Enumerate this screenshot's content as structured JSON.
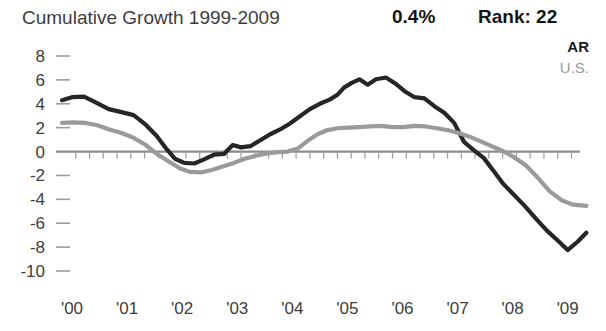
{
  "header": {
    "title": "Cumulative Growth 1999-2009",
    "growth_value": "0.4%",
    "rank_value": "Rank: 22"
  },
  "legend": {
    "entries": [
      {
        "label": "AR",
        "color": "#262626"
      },
      {
        "label": "U.S.",
        "color": "#9a9a9a"
      }
    ]
  },
  "chart_data": {
    "type": "line",
    "title": "Cumulative Growth 1999-2009",
    "xlabel": "",
    "ylabel": "",
    "ylim": [
      -10,
      8
    ],
    "xlim": [
      0,
      9.55
    ],
    "grid": false,
    "legend_position": "top-right",
    "y_ticks": [
      8,
      6,
      4,
      2,
      0,
      -2,
      -4,
      -6,
      -8,
      -10
    ],
    "y_tick_labels": [
      "8",
      "6",
      "4",
      "2",
      "0",
      "-2",
      "-4",
      "-6",
      "-8",
      "-10"
    ],
    "x_ticks": [
      0,
      1,
      2,
      3,
      4,
      5,
      6,
      7,
      8,
      9
    ],
    "x_tick_labels": [
      "'00",
      "'01",
      "'02",
      "'03",
      "'04",
      "'05",
      "'06",
      "'07",
      "'08",
      "'09"
    ],
    "annotations": [
      {
        "text": "0.4%",
        "role": "cumulative-growth"
      },
      {
        "text": "Rank: 22",
        "role": "rank"
      }
    ],
    "series": [
      {
        "name": "AR",
        "color": "#262626",
        "width": 4.2,
        "x": [
          0.0,
          0.18,
          0.4,
          0.62,
          0.85,
          1.08,
          1.3,
          1.52,
          1.72,
          1.9,
          2.05,
          2.22,
          2.4,
          2.58,
          2.76,
          2.94,
          3.1,
          3.25,
          3.42,
          3.6,
          3.78,
          3.96,
          4.14,
          4.32,
          4.5,
          4.68,
          4.86,
          5.0,
          5.12,
          5.26,
          5.4,
          5.55,
          5.7,
          5.88,
          6.05,
          6.22,
          6.4,
          6.58,
          6.76,
          6.94,
          7.12,
          7.3,
          7.48,
          7.66,
          7.84,
          8.02,
          8.2,
          8.4,
          8.6,
          8.8,
          9.0,
          9.18,
          9.36,
          9.52
        ],
        "y": [
          4.3,
          4.55,
          4.6,
          4.1,
          3.55,
          3.3,
          3.05,
          2.25,
          1.3,
          0.2,
          -0.6,
          -0.95,
          -1.0,
          -0.65,
          -0.25,
          -0.2,
          0.55,
          0.35,
          0.45,
          0.95,
          1.45,
          1.85,
          2.35,
          2.95,
          3.55,
          4.0,
          4.35,
          4.75,
          5.35,
          5.75,
          6.05,
          5.6,
          6.05,
          6.2,
          5.7,
          5.05,
          4.55,
          4.45,
          3.8,
          3.25,
          2.4,
          0.8,
          0.1,
          -0.55,
          -1.65,
          -2.75,
          -3.6,
          -4.55,
          -5.6,
          -6.6,
          -7.45,
          -8.25,
          -7.55,
          -6.8
        ],
        "end_value": -6.8
      },
      {
        "name": "U.S.",
        "color": "#9a9a9a",
        "width": 4.2,
        "x": [
          0.0,
          0.2,
          0.42,
          0.64,
          0.86,
          1.08,
          1.3,
          1.52,
          1.74,
          1.96,
          2.14,
          2.32,
          2.52,
          2.72,
          2.92,
          3.12,
          3.32,
          3.52,
          3.72,
          3.92,
          4.1,
          4.28,
          4.46,
          4.64,
          4.82,
          5.0,
          5.2,
          5.4,
          5.6,
          5.8,
          6.0,
          6.2,
          6.4,
          6.6,
          6.8,
          7.0,
          7.2,
          7.4,
          7.6,
          7.8,
          8.0,
          8.2,
          8.42,
          8.64,
          8.86,
          9.08,
          9.28,
          9.52
        ],
        "y": [
          2.4,
          2.45,
          2.4,
          2.2,
          1.85,
          1.55,
          1.15,
          0.55,
          -0.25,
          -0.9,
          -1.4,
          -1.7,
          -1.75,
          -1.55,
          -1.25,
          -0.95,
          -0.6,
          -0.35,
          -0.15,
          -0.05,
          0.0,
          0.25,
          0.9,
          1.45,
          1.8,
          1.95,
          2.0,
          2.05,
          2.1,
          2.15,
          2.05,
          2.05,
          2.15,
          2.1,
          1.95,
          1.8,
          1.55,
          1.25,
          0.85,
          0.45,
          0.05,
          -0.45,
          -1.15,
          -2.2,
          -3.35,
          -4.1,
          -4.45,
          -4.55
        ],
        "end_value": -4.55
      }
    ]
  }
}
